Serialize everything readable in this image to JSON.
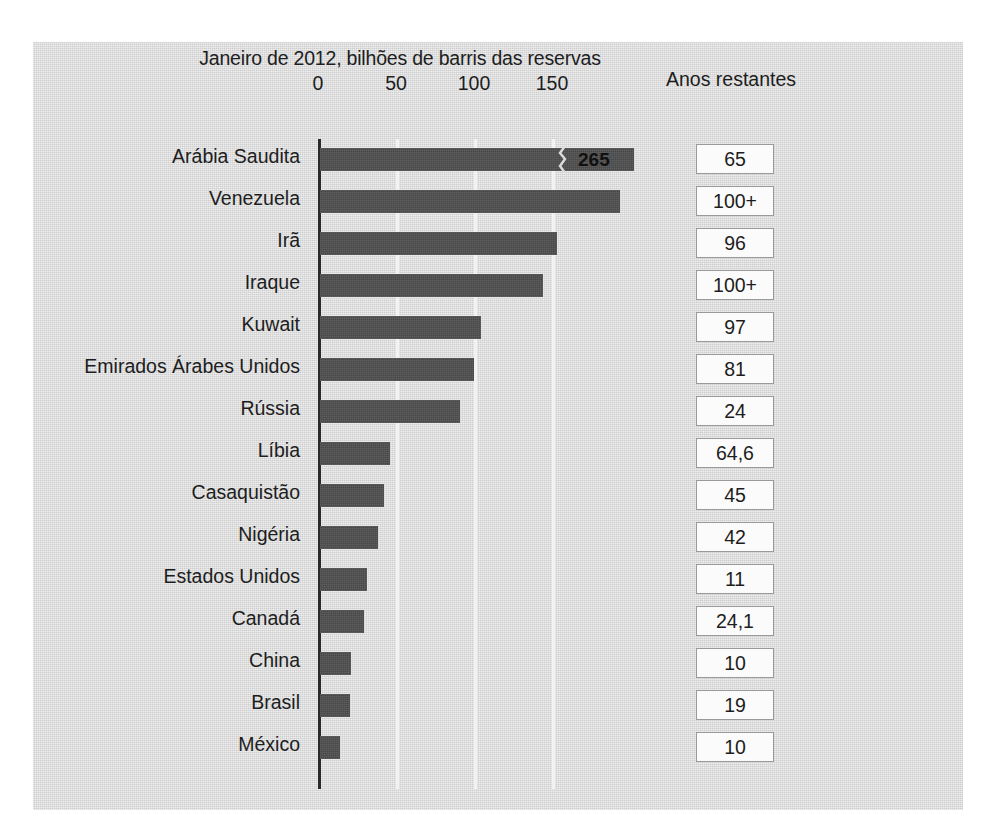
{
  "chart_data": {
    "type": "bar",
    "title": "Janeiro de 2012, bilhões de barris das reservas",
    "xlabel": "",
    "ylabel": "",
    "orientation": "horizontal",
    "xlim": [
      0,
      200
    ],
    "xticks": [
      0,
      50,
      100,
      150
    ],
    "xtick_labels": [
      "0",
      "50",
      "100",
      "150"
    ],
    "grid": true,
    "legend": null,
    "extra_column_header": "Anos restantes",
    "categories": [
      "Arábia Saudita",
      "Venezuela",
      "Irã",
      "Iraque",
      "Kuwait",
      "Emirados Árabes Unidos",
      "Rússia",
      "Líbia",
      "Casaquistão",
      "Nigéria",
      "Estados Unidos",
      "Canadá",
      "China",
      "Brasil",
      "México"
    ],
    "values": [
      265,
      192,
      152,
      143,
      103,
      99,
      90,
      45,
      41,
      37,
      30,
      28,
      20,
      19,
      13
    ],
    "display_values": [
      "265",
      "",
      "",
      "",
      "",
      "",
      "",
      "",
      "",
      "",
      "",
      "",
      "",
      "",
      ""
    ],
    "truncated_bars": [
      true,
      false,
      false,
      false,
      false,
      false,
      false,
      false,
      false,
      false,
      false,
      false,
      false,
      false,
      false
    ],
    "years_remaining": [
      "65",
      "100+",
      "96",
      "100+",
      "97",
      "81",
      "24",
      "64,6",
      "45",
      "42",
      "11",
      "24,1",
      "10",
      "19",
      "10"
    ],
    "annotations": [
      {
        "label": "265",
        "note": "axis break zigzag on Arábia Saudita bar"
      }
    ],
    "colors": {
      "bar": "#4f4f4f",
      "panel_background": "#d6d6d6",
      "gridline": "#f2f2f2",
      "axis_line": "#2a2a2a",
      "text": "#1d1d1d",
      "box_background": "#fbfbfb",
      "box_border": "#9a9a9a"
    }
  }
}
